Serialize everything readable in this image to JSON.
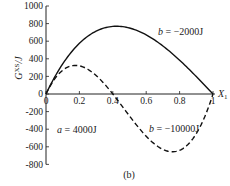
{
  "chart_data": {
    "type": "line",
    "title": "",
    "caption": "(b)",
    "xlabel": "X1",
    "ylabel": "G^XS/J",
    "xlim": [
      0,
      1
    ],
    "ylim": [
      -800,
      1000
    ],
    "xticks": [
      "0",
      "0.2",
      "0.4",
      "0.6",
      "0.8",
      "1"
    ],
    "yticks": [
      "1000",
      "800",
      "600",
      "400",
      "200",
      "0",
      "-200",
      "-400",
      "-600",
      "-800"
    ],
    "grid": false,
    "model": "G = a*X1*(1-X1) + b*X1^2*(1-X1)",
    "annotations": [
      {
        "text": "a = 4000J",
        "x": 0.05,
        "y": -420
      },
      {
        "text": "b = −2000J",
        "x": 0.72,
        "y": 620
      },
      {
        "text": "b = −10000J",
        "x": 0.62,
        "y": -420
      }
    ],
    "x": [
      0,
      0.05,
      0.1,
      0.15,
      0.2,
      0.25,
      0.3,
      0.35,
      0.4,
      0.45,
      0.5,
      0.55,
      0.6,
      0.65,
      0.7,
      0.75,
      0.8,
      0.85,
      0.9,
      0.95,
      1.0
    ],
    "series": [
      {
        "name": "b = −2000J",
        "style": "solid",
        "values": [
          0,
          185,
          342,
          472,
          576,
          656,
          714,
          751,
          768,
          767,
          750,
          718,
          672,
          614,
          546,
          469,
          384,
          293,
          198,
          99,
          0
        ]
      },
      {
        "name": "b = −10000J",
        "style": "dashed",
        "values": [
          0,
          166,
          279,
          338,
          352,
          328,
          273,
          193,
          96,
          -12,
          -125,
          -236,
          -336,
          -421,
          -483,
          -516,
          -512,
          -466,
          -369,
          -214,
          0
        ]
      }
    ]
  },
  "labels": {
    "caption": "(b)",
    "xlabel_main": "X",
    "xlabel_sub": "1",
    "ylabel_main": "G",
    "ylabel_sup": "XS",
    "ylabel_unit": "/J",
    "ann_a": "a = 4000J",
    "ann_b1": "b = −2000J",
    "ann_b2": "b = −10000J",
    "ann_a_var": "a",
    "ann_a_val": " = 4000J",
    "ann_b1_var": "b",
    "ann_b1_val": " = −2000J",
    "ann_b2_var": "b",
    "ann_b2_val": " = −10000J"
  },
  "ticks": {
    "y": [
      {
        "label": "1000",
        "v": 1000
      },
      {
        "label": "800",
        "v": 800
      },
      {
        "label": "600",
        "v": 600
      },
      {
        "label": "400",
        "v": 400
      },
      {
        "label": "200",
        "v": 200
      },
      {
        "label": "0",
        "v": 0
      },
      {
        "label": "-200",
        "v": -200
      },
      {
        "label": "-400",
        "v": -400
      },
      {
        "label": "-600",
        "v": -600
      },
      {
        "label": "-800",
        "v": -800
      }
    ],
    "x": [
      {
        "label": "0",
        "v": 0
      },
      {
        "label": "0.2",
        "v": 0.2
      },
      {
        "label": "0.4",
        "v": 0.4
      },
      {
        "label": "0.6",
        "v": 0.6
      },
      {
        "label": "0.8",
        "v": 0.8
      },
      {
        "label": "1",
        "v": 1
      }
    ]
  }
}
